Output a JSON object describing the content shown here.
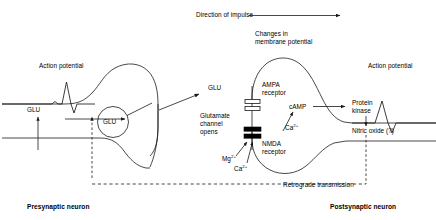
{
  "figure": {
    "type": "diagram",
    "header": {
      "direction_label": "Direction of impulse"
    },
    "presynaptic": {
      "region_label": "Presynaptic neuron",
      "action_potential_label": "Action potential",
      "neurotransmitter_uptake_label": "GLU",
      "vesicle_label": "GLU",
      "release_label": "GLU"
    },
    "cleft": {
      "channel_label_line1": "Glutamate",
      "channel_label_line2": "channel",
      "channel_label_line3": "opens",
      "ions": [
        {
          "name": "magnesium",
          "label": "Mg",
          "charge": "2+"
        },
        {
          "name": "calcium-influx",
          "label": "Ca",
          "charge": "2+"
        }
      ]
    },
    "postsynaptic": {
      "region_label": "Postsynaptic neuron",
      "membrane_potential_line1": "Changes in",
      "membrane_potential_line2": "membrane potential",
      "ampa_line1": "AMPA",
      "ampa_line2": "receptor",
      "nmda_line1": "NMDA",
      "nmda_line2": "receptor",
      "second_messenger_label": "cAMP",
      "calcium_label": "Ca",
      "calcium_charge": "2+",
      "kinase_line1": "Protein",
      "kinase_line2": "kinase",
      "nitric_oxide_label": "Nitric oxide (?)",
      "action_potential_label": "Action potential"
    },
    "feedback": {
      "retrograde_label": "Retrograde transmission"
    },
    "colors": {
      "stroke": "#1a1a1a",
      "text": "#000000",
      "background": "#ffffff",
      "receptor_open_fill": "#ffffff",
      "receptor_closed_fill": "#000000"
    }
  }
}
